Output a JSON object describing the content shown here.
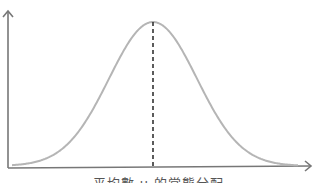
{
  "diagram": {
    "type": "normal-distribution-curve",
    "caption": "平均數 μ 的常態分配",
    "colors": {
      "axis": "#777777",
      "curve": "#b5b5b5",
      "mean_line": "#333333",
      "caption": "#555555"
    },
    "curve": {
      "peak_x": 153,
      "peak_y": 22,
      "baseline_y": 166,
      "x_start": 12,
      "x_end": 298,
      "sigma_px": 44
    },
    "mean_line": {
      "style": "dashed",
      "label": "μ"
    }
  }
}
